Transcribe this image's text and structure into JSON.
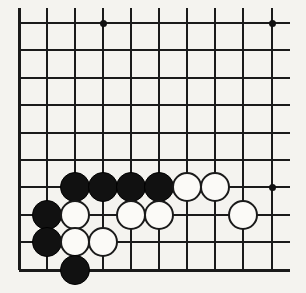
{
  "diagram": {
    "title": "Go board corner diagram",
    "board_type": "go-board",
    "background_color": "#f4f3ef",
    "line_color": "#1a1a1a",
    "black_stone_color": "#111111",
    "white_stone_color": "#fbfaf7",
    "cropped": true,
    "visible_columns": 10,
    "visible_rows": 10,
    "grid": {
      "column_x": [
        19,
        47,
        75,
        103,
        131,
        159,
        187,
        215,
        243,
        272
      ],
      "row_y": [
        23,
        50,
        78,
        105,
        133,
        160,
        187,
        215,
        242,
        270
      ],
      "spacing_px": 27.6,
      "left_edge_x": 19,
      "bottom_edge_y": 270,
      "right_overhang_x": 290,
      "top_overhang_y": 8
    },
    "star_points": [
      {
        "label": "star-point-top-left",
        "col": 3,
        "row": 0
      },
      {
        "label": "star-point-top-right",
        "col": 9,
        "row": 0
      },
      {
        "label": "star-point-bottom-right",
        "col": 9,
        "row": 6
      }
    ],
    "stone_radius_px": 15,
    "stones": [
      {
        "id": "black-1",
        "color": "black",
        "col": 2,
        "row": 6
      },
      {
        "id": "black-2",
        "color": "black",
        "col": 3,
        "row": 6
      },
      {
        "id": "black-3",
        "color": "black",
        "col": 4,
        "row": 6
      },
      {
        "id": "black-4",
        "color": "black",
        "col": 5,
        "row": 6
      },
      {
        "id": "white-1",
        "color": "white",
        "col": 6,
        "row": 6
      },
      {
        "id": "white-2",
        "color": "white",
        "col": 7,
        "row": 6
      },
      {
        "id": "black-5",
        "color": "black",
        "col": 1,
        "row": 7
      },
      {
        "id": "white-3",
        "color": "white",
        "col": 2,
        "row": 7
      },
      {
        "id": "white-4",
        "color": "white",
        "col": 4,
        "row": 7
      },
      {
        "id": "white-5",
        "color": "white",
        "col": 5,
        "row": 7
      },
      {
        "id": "white-6",
        "color": "white",
        "col": 8,
        "row": 7
      },
      {
        "id": "black-6",
        "color": "black",
        "col": 1,
        "row": 8
      },
      {
        "id": "white-7",
        "color": "white",
        "col": 2,
        "row": 8
      },
      {
        "id": "white-8",
        "color": "white",
        "col": 3,
        "row": 8
      },
      {
        "id": "black-7",
        "color": "black",
        "col": 2,
        "row": 9
      }
    ],
    "counts": {
      "black_stones": "7",
      "white_stones": "8",
      "total_stones": "15"
    }
  }
}
